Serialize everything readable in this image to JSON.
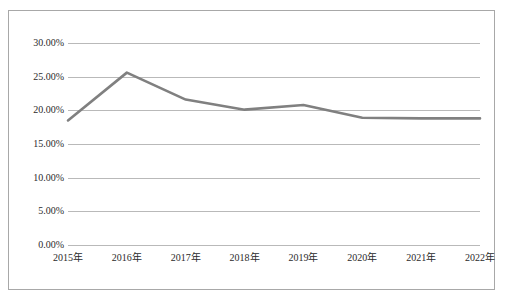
{
  "figure": {
    "border_color": "#a8a8a8",
    "background": "#ffffff"
  },
  "chart_data": {
    "type": "line",
    "title": "",
    "subtitle": "",
    "xlabel": "",
    "ylabel": "",
    "categories": [
      "2015年",
      "2016年",
      "2017年",
      "2018年",
      "2019年",
      "2020年",
      "2021年",
      "2022年"
    ],
    "values": [
      18.5,
      25.6,
      21.6,
      20.1,
      20.8,
      18.9,
      18.8,
      18.8
    ],
    "value_labels": [
      "18.50%",
      "25.60%",
      "21.60%",
      "20.10%",
      "20.80%",
      "18.90%",
      "18.80%",
      "18.80%"
    ],
    "ylim": [
      0,
      30
    ],
    "ytick_values": [
      0,
      5,
      10,
      15,
      20,
      25,
      30
    ],
    "ytick_labels": [
      "0.00%",
      "5.00%",
      "10.00%",
      "15.00%",
      "20.00%",
      "25.00%",
      "30.00%"
    ],
    "grid": true,
    "grid_color": "#b9b9b9",
    "legend": false,
    "legend_position": "none",
    "series": [
      {
        "name": "",
        "color": "#808080",
        "line_width": 2.6,
        "values": [
          18.5,
          25.6,
          21.6,
          20.1,
          20.8,
          18.9,
          18.8,
          18.8
        ]
      }
    ],
    "annotations": []
  }
}
